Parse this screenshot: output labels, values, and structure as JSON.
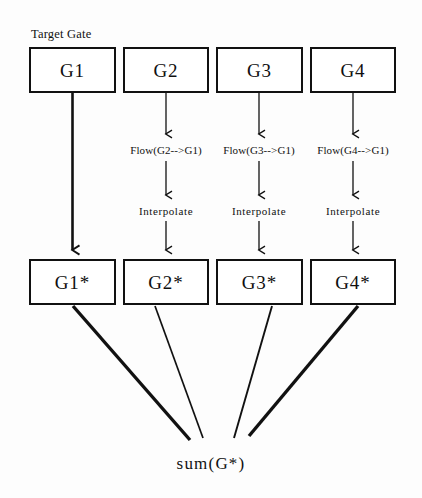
{
  "diagram": {
    "title_caption": "Target Gate",
    "result_label": "sum(G*)",
    "source_gates": [
      {
        "label": "G1",
        "x": 29,
        "y": 47,
        "w": 87,
        "h": 46
      },
      {
        "label": "G2",
        "x": 123,
        "y": 47,
        "w": 86,
        "h": 46
      },
      {
        "label": "G3",
        "x": 216,
        "y": 47,
        "w": 87,
        "h": 46
      },
      {
        "label": "G4",
        "x": 310,
        "y": 47,
        "w": 86,
        "h": 46
      }
    ],
    "warped_gates": [
      {
        "label": "G1*",
        "x": 29,
        "y": 259,
        "w": 87,
        "h": 46
      },
      {
        "label": "G2*",
        "x": 123,
        "y": 259,
        "w": 86,
        "h": 46
      },
      {
        "label": "G3*",
        "x": 216,
        "y": 259,
        "w": 87,
        "h": 46
      },
      {
        "label": "G4*",
        "x": 310,
        "y": 259,
        "w": 86,
        "h": 46
      }
    ],
    "flow_steps": [
      {
        "label": "Flow(G2-->G1)",
        "cx": 166,
        "y": 145
      },
      {
        "label": "Flow(G3-->G1)",
        "cx": 259,
        "y": 145
      },
      {
        "label": "Flow(G4-->G1)",
        "cx": 353,
        "y": 145
      }
    ],
    "interpolate_steps": [
      {
        "label": "Interpolate",
        "cx": 166,
        "y": 206
      },
      {
        "label": "Interpolate",
        "cx": 259,
        "y": 206
      },
      {
        "label": "Interpolate",
        "cx": 353,
        "y": 206
      }
    ],
    "colors": {
      "stroke": "#111111",
      "box_fill": "#ffffff",
      "background": "#fdfdfd",
      "text": "#101010"
    }
  }
}
